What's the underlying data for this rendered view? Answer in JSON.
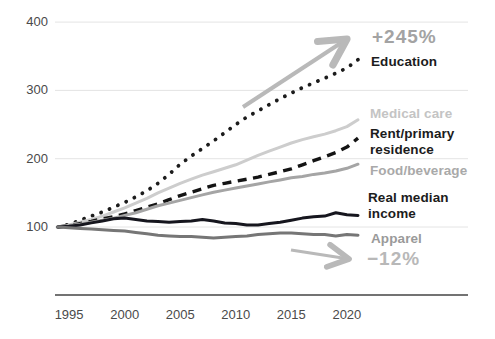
{
  "chart_data": {
    "type": "line",
    "title": "",
    "xlabel": "",
    "ylabel": "",
    "grid": true,
    "legend_position": "right-margin-inline-labels",
    "x": [
      1994,
      1995,
      1996,
      1997,
      1998,
      1999,
      2000,
      2001,
      2002,
      2003,
      2004,
      2005,
      2006,
      2007,
      2008,
      2009,
      2010,
      2011,
      2012,
      2013,
      2014,
      2015,
      2016,
      2017,
      2018,
      2019,
      2020,
      2021
    ],
    "xlim": [
      1994,
      2021
    ],
    "ylim": [
      60,
      420
    ],
    "xticks": [
      1995,
      2000,
      2005,
      2010,
      2015,
      2020
    ],
    "xtick_labels": [
      "1995",
      "2000",
      "2005",
      "2010",
      "2015",
      "2020"
    ],
    "ytick_values": [
      400,
      300,
      200,
      100
    ],
    "ytick_labels": [
      "400",
      "300",
      "200",
      "100"
    ],
    "axis_color": "#454545",
    "grid_color": "#e4e4e4",
    "tick_color": "#4a4a4a",
    "series": [
      {
        "name": "Education",
        "style": "dotted",
        "color": "#1c1c1c",
        "label_color": "#1c1c1c",
        "values": [
          100,
          104,
          110,
          116,
          122,
          129,
          136,
          144,
          153,
          164,
          177,
          192,
          204,
          215,
          226,
          238,
          250,
          261,
          270,
          279,
          288,
          296,
          304,
          311,
          318,
          325,
          333,
          345
        ]
      },
      {
        "name": "Medical care",
        "style": "solid",
        "color": "#cdcdcd",
        "label_color": "#c4c4c4",
        "values": [
          100,
          103,
          107,
          111,
          116,
          122,
          128,
          135,
          142,
          150,
          157,
          164,
          170,
          176,
          181,
          186,
          191,
          198,
          205,
          211,
          217,
          223,
          228,
          232,
          236,
          241,
          247,
          257
        ]
      },
      {
        "name": "Rent/primary residence",
        "style": "dashed",
        "color": "#141414",
        "label_color": "#1c1c1c",
        "values": [
          100,
          102,
          105,
          108,
          112,
          115,
          119,
          124,
          129,
          134,
          140,
          146,
          151,
          156,
          161,
          164,
          167,
          170,
          173,
          177,
          181,
          185,
          191,
          197,
          203,
          209,
          217,
          230
        ]
      },
      {
        "name": "Food/beverage",
        "style": "solid",
        "color": "#a5a5a5",
        "label_color": "#a9a9a9",
        "values": [
          100,
          102,
          104,
          107,
          110,
          113,
          117,
          121,
          126,
          131,
          135,
          139,
          143,
          147,
          151,
          154,
          157,
          160,
          163,
          166,
          169,
          172,
          174,
          177,
          179,
          182,
          186,
          192
        ]
      },
      {
        "name": "Real median income",
        "style": "solid",
        "color": "#16161e",
        "label_color": "#1c1c1c",
        "values": [
          100,
          101,
          103,
          106,
          109,
          112,
          113,
          111,
          109,
          108,
          107,
          108,
          109,
          111,
          109,
          106,
          105,
          103,
          103,
          105,
          107,
          110,
          113,
          115,
          116,
          121,
          118,
          117
        ]
      },
      {
        "name": "Apparel",
        "style": "solid",
        "color": "#767676",
        "label_color": "#9a9a9a",
        "values": [
          100,
          99,
          98,
          97,
          96,
          95,
          94,
          92,
          90,
          88,
          87,
          86,
          86,
          85,
          84,
          85,
          86,
          87,
          89,
          90,
          91,
          91,
          90,
          89,
          89,
          87,
          89,
          88
        ]
      }
    ],
    "annotations": [
      {
        "text": "+245%",
        "color": "#a3a3a3",
        "refers_to": "Education"
      },
      {
        "text": "−12%",
        "color": "#b8b8b8",
        "refers_to": "Apparel"
      }
    ],
    "arrow_color": "#b9b9b9"
  }
}
